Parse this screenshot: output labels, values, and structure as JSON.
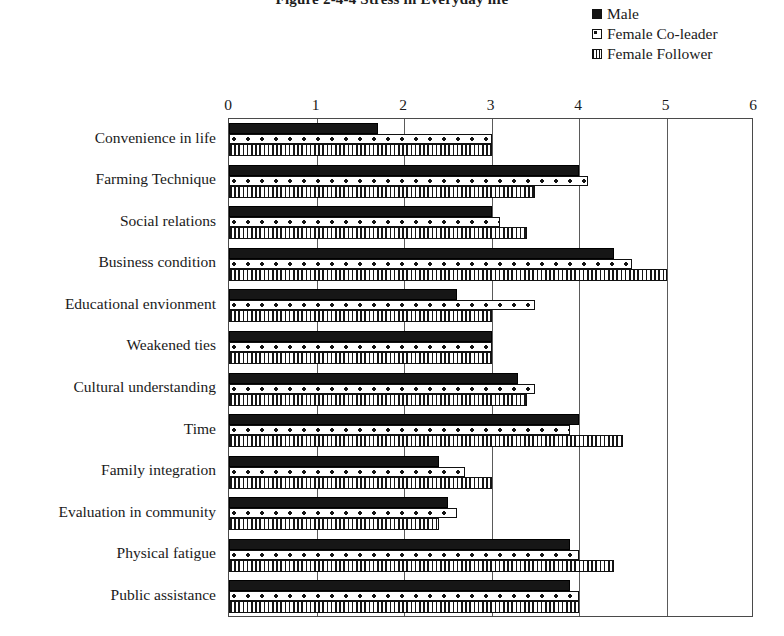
{
  "title": "Figure 2-4-4 Stress in Everyday life",
  "legend": {
    "position": "top-right",
    "entries": [
      {
        "label": "Male",
        "key": "male-swatch"
      },
      {
        "label": "Female  Co-leader",
        "key": "female-coleader-swatch"
      },
      {
        "label": "Female Follower",
        "key": "female-follower-swatch"
      }
    ]
  },
  "chart_data": {
    "type": "bar",
    "orientation": "horizontal",
    "title": "Figure 2-4-4 Stress in Everyday life",
    "xlabel": "",
    "ylabel": "",
    "xlim": [
      0,
      6
    ],
    "xticks": [
      0,
      1,
      2,
      3,
      4,
      5,
      6
    ],
    "grid": true,
    "legend_position": "top-right",
    "categories": [
      "Convenience in life",
      "Farming Technique",
      "Social relations",
      "Business condition",
      "Educational envionment",
      "Weakened ties",
      "Cultural understanding",
      "Time",
      "Family integration",
      "Evaluation in community",
      "Physical fatigue",
      "Public assistance"
    ],
    "series": [
      {
        "name": "Male",
        "values": [
          1.7,
          4.0,
          3.0,
          4.4,
          2.6,
          3.0,
          3.3,
          4.0,
          2.4,
          2.5,
          3.9,
          3.9
        ]
      },
      {
        "name": "Female  Co-leader",
        "values": [
          3.0,
          4.1,
          3.1,
          4.6,
          3.5,
          3.0,
          3.5,
          3.9,
          2.7,
          2.6,
          4.0,
          4.0
        ]
      },
      {
        "name": "Female Follower",
        "values": [
          3.0,
          3.5,
          3.4,
          5.0,
          3.0,
          3.0,
          3.4,
          4.5,
          3.0,
          2.4,
          4.4,
          4.0
        ]
      }
    ]
  }
}
